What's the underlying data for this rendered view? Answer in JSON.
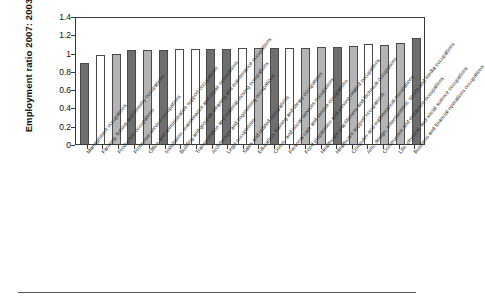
{
  "chart_data": {
    "type": "bar",
    "title": "",
    "subtitle": "",
    "xlabel": "",
    "ylabel": "Employment ratio 2007: 2003",
    "ylim": [
      0,
      1.4
    ],
    "ytick_labels": [
      "1.4",
      "1.2",
      "1",
      "0.8",
      "0.6",
      "0.4",
      "0.2",
      "0"
    ],
    "ytick_values": [
      1.4,
      1.2,
      1.0,
      0.8,
      0.6,
      0.4,
      0.2,
      0
    ],
    "grid": false,
    "legend": "none",
    "bar_colors": {
      "dark": "#6e6e6e",
      "white": "#ffffff",
      "light": "#b4b4b4",
      "edge": "#4a4a4a"
    },
    "categories": [
      "Management occupations",
      "Farming, fishing and forestry occupations",
      "Production occupations",
      "Protective service occupations",
      "Office and administrative support occupations",
      "Installation, maintenance and repair occupations",
      "Building and grounds cleaning and maintenance occupations",
      "Transportation and material moving occupations",
      "Architecture and engineering occupations",
      "Legal occupations",
      "Sales and related occupations",
      "Education, training and library occupations",
      "Comm. and social services occupations",
      "Personal care and service occupations",
      "Food preparation and serving related occupations",
      "Healthcare practitioners and technical occupations",
      "Healthcare support occupations",
      "Computer and mathematical occupations",
      "Arts, design, entertainment, sports and media occupations",
      "Construction and extraction occupations",
      "Life, physical, and social science occupations",
      "Business and financial operations occupations"
    ],
    "values": [
      0.89,
      0.975,
      0.985,
      1.03,
      1.03,
      1.03,
      1.035,
      1.035,
      1.035,
      1.035,
      1.045,
      1.05,
      1.05,
      1.055,
      1.055,
      1.06,
      1.06,
      1.075,
      1.09,
      1.08,
      1.105,
      1.155
    ],
    "bar_shades": [
      "dark",
      "white",
      "light",
      "dark",
      "light",
      "dark",
      "white",
      "white",
      "dark",
      "dark",
      "white",
      "light",
      "dark",
      "white",
      "light",
      "light",
      "dark",
      "light",
      "white",
      "light",
      "light",
      "dark"
    ]
  }
}
